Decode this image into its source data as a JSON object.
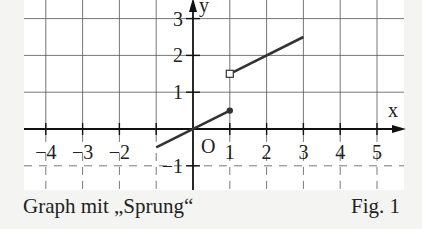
{
  "chart_data": {
    "type": "line",
    "title": "Graph mit „Sprung“",
    "figure_label": "Fig. 1",
    "xlabel": "x",
    "ylabel": "y",
    "origin_label": "O",
    "xlim": [
      -4.4,
      5.5
    ],
    "ylim": [
      -1.3,
      3.4
    ],
    "grid": true,
    "x_ticks": [
      -4,
      -3,
      -2,
      -1,
      1,
      2,
      3,
      4,
      5
    ],
    "x_tick_labels": [
      "−4",
      "−3",
      "−2",
      "1",
      "2",
      "3",
      "4",
      "5"
    ],
    "y_ticks": [
      -1,
      1,
      2,
      3
    ],
    "y_tick_labels": [
      "−1",
      "1",
      "2",
      "3"
    ],
    "series": [
      {
        "name": "left piece",
        "x": [
          -1,
          1
        ],
        "y": [
          -0.5,
          0.5
        ],
        "end_marker": "filled-dot"
      },
      {
        "name": "right piece",
        "x": [
          1,
          3
        ],
        "y": [
          1.5,
          2.5
        ],
        "start_marker": "open-square"
      }
    ]
  },
  "caption": {
    "left": "Graph mit „Sprung“",
    "right": "Fig. 1"
  },
  "colors": {
    "background": "#f4f4f2",
    "plot_background": "#ffffff",
    "grid": "#555555",
    "axis": "#111111",
    "line": "#333333"
  }
}
